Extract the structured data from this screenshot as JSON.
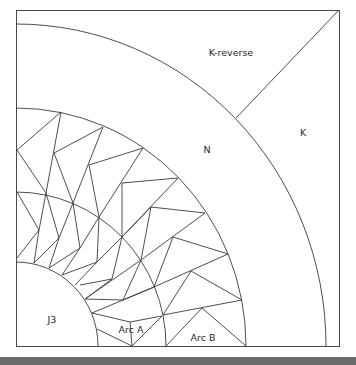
{
  "diagram": {
    "labels": {
      "k_reverse": "K-reverse",
      "k": "K",
      "n": "N",
      "j3": "J3",
      "arc_a": "Arc A",
      "arc_b": "Arc B"
    },
    "regions": [
      {
        "id": "k_reverse",
        "name": "K-reverse"
      },
      {
        "id": "k",
        "name": "K"
      },
      {
        "id": "n",
        "name": "N"
      },
      {
        "id": "arc_b",
        "name": "Arc B"
      },
      {
        "id": "arc_a",
        "name": "Arc A"
      },
      {
        "id": "j3",
        "name": "J3"
      }
    ],
    "colors": {
      "line": "#3a3a3a",
      "background": "#ffffff",
      "footer_band": "#6b6b6b"
    }
  }
}
